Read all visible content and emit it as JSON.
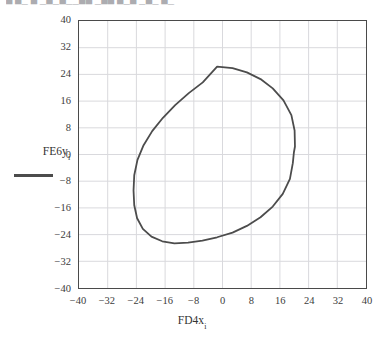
{
  "page": {
    "top_clipped_text": "▀ ▀▄ ▀ ▄▀▄▀▄▄▀▀ ▄▀▀ ▀▄▀ ▄▀▄ ▀▄"
  },
  "axes": {
    "x_title_main": "FD4x",
    "x_title_sub": "i",
    "y_title_main": "FE6y",
    "y_title_sub": "i",
    "x_ticks": [
      "−40",
      "−32",
      "−24",
      "−16",
      "−8",
      "0",
      "8",
      "16",
      "24",
      "32",
      "40"
    ],
    "y_ticks": [
      "40",
      "32",
      "24",
      "16",
      "8",
      "0",
      "−8",
      "−16",
      "−24",
      "−32",
      "−40"
    ]
  },
  "style": {
    "curve_color": "#4c4c4c",
    "grid_color": "#d9d9dd",
    "frame_color": "#4a4a4a"
  },
  "chart_data": {
    "type": "line",
    "title": "",
    "subtitle": "",
    "xlabel": "FD4x_i",
    "ylabel": "FE6y_i",
    "xlim": [
      -40,
      40
    ],
    "ylim": [
      -40,
      40
    ],
    "xticks": [
      -40,
      -32,
      -24,
      -16,
      -8,
      0,
      8,
      16,
      24,
      32,
      40
    ],
    "yticks": [
      -40,
      -32,
      -24,
      -16,
      -8,
      0,
      8,
      16,
      24,
      32,
      40
    ],
    "grid": true,
    "legend": false,
    "legend_position": "outside-left",
    "series": [
      {
        "name": "FE6y_i vs FD4x_i",
        "closed": true,
        "marker": "none",
        "linewidth": 1.8,
        "color": "#4c4c4c",
        "x": [
          -1.5,
          2.8,
          6.8,
          10.6,
          14.0,
          17.0,
          19.2,
          20.1,
          20.2,
          19.9,
          19.6,
          18.8,
          16.8,
          14.0,
          10.6,
          6.8,
          2.8,
          -1.5,
          -5.6,
          -9.6,
          -13.4,
          -16.8,
          -19.8,
          -22.2,
          -23.8,
          -24.6,
          -24.8,
          -24.6,
          -23.7,
          -22.0,
          -19.6,
          -16.6,
          -13.2,
          -9.4,
          -5.5
        ],
        "y": [
          26.3,
          25.9,
          24.6,
          22.6,
          19.8,
          16.2,
          11.8,
          7.2,
          2.4,
          0.6,
          -2.6,
          -7.3,
          -11.8,
          -15.6,
          -18.8,
          -21.4,
          -23.4,
          -24.8,
          -25.8,
          -26.4,
          -26.6,
          -26.0,
          -24.6,
          -22.3,
          -19.1,
          -15.2,
          -10.8,
          -6.2,
          -1.6,
          2.8,
          7.0,
          11.0,
          14.8,
          18.4,
          21.6
        ]
      }
    ]
  }
}
